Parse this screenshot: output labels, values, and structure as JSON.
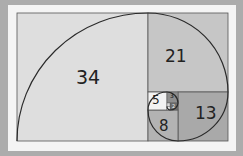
{
  "diagram": {
    "squares": [
      {
        "label": "34",
        "x": 17,
        "y": 13,
        "size": 131,
        "fill": "#dedede"
      },
      {
        "label": "21",
        "x": 148,
        "y": 13,
        "size": 80,
        "fill": "#c6c6c6"
      },
      {
        "label": "13",
        "x": 178,
        "y": 92,
        "size": 50,
        "fill": "#a9a9a9"
      },
      {
        "label": "8",
        "x": 148,
        "y": 110,
        "size": 30,
        "fill": "#b3b3b3"
      },
      {
        "label": "5",
        "x": 148,
        "y": 92,
        "size": 19,
        "fill": "#f2f2f2"
      },
      {
        "label": "3",
        "x": 167,
        "y": 92,
        "size": 11,
        "fill": "#8e8e8e"
      },
      {
        "label": "2",
        "x": 167,
        "y": 103,
        "size": 7,
        "fill": "#6e6e6e"
      },
      {
        "label": "1",
        "x": 174,
        "y": 103,
        "size": 4,
        "fill": "#d8d8d8"
      }
    ],
    "colors": {
      "background": "#acacac",
      "card": "#f4f4f4",
      "line": "#3a3a3a",
      "spiral": "#2a2a2a"
    }
  }
}
